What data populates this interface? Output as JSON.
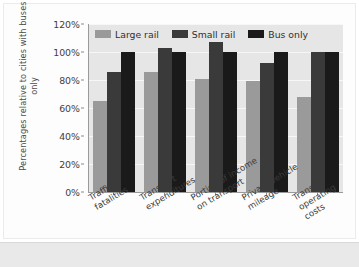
{
  "chart_data": {
    "type": "bar",
    "title": "",
    "xlabel": "",
    "ylabel": "Percentages relative to cities with buses only",
    "categories": [
      "Traffic\nfatalities",
      "Transport\nexpenditures",
      "Portion of income\non transport",
      "Private vehicle\nmileage",
      "Transit\noperating\ncosts"
    ],
    "series": [
      {
        "name": "Large rail",
        "color": "#9a9a9a",
        "values": [
          65,
          86,
          81,
          79,
          68
        ]
      },
      {
        "name": "Small rail",
        "color": "#3a3a3a",
        "values": [
          86,
          103,
          107,
          92,
          100
        ]
      },
      {
        "name": "Bus only",
        "color": "#1a1a1a",
        "values": [
          100,
          100,
          100,
          100,
          100
        ]
      }
    ],
    "ylim": [
      0,
      120
    ],
    "ytick_values": [
      120,
      100,
      80,
      60,
      40,
      20,
      0
    ],
    "ytick_labels": [
      "120%",
      "100%",
      "80%",
      "60%",
      "40%",
      "20%",
      "0%"
    ],
    "grid": true,
    "legend_position": "top-inside",
    "units": "percent"
  },
  "legend": {
    "items": [
      {
        "label": "Large rail"
      },
      {
        "label": "Small rail"
      },
      {
        "label": "Bus only"
      }
    ]
  },
  "colors": {
    "plot_background": "#e6e6e6",
    "gridline": "#f7f7f7",
    "axis": "#9a9a9a",
    "page_background": "#ffffff",
    "bottom_band": "#e9e9e9",
    "large_rail": "#9a9a9a",
    "small_rail": "#3a3a3a",
    "bus_only": "#1a1a1a"
  }
}
